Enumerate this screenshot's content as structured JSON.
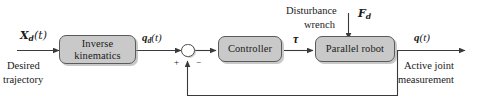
{
  "diagram": {
    "colors": {
      "block_fill": "#c9c9c9",
      "block_border": "#5a5a5a",
      "wire": "#3a3a3a",
      "text": "#1a1a1a",
      "background": "#ffffff"
    },
    "blocks": [
      {
        "id": "inverse-kinematics",
        "line1": "Inverse",
        "line2": "kinematics"
      },
      {
        "id": "controller",
        "line1": "Controller",
        "line2": ""
      },
      {
        "id": "parallel-robot",
        "line1": "Parallel robot",
        "line2": ""
      }
    ],
    "signals": {
      "input_symbol": {
        "base": "X",
        "sub": "d",
        "arg": "(t)"
      },
      "input_caption_line1": "Desired",
      "input_caption_line2": "trajectory",
      "desired_joint_symbol": {
        "base": "q",
        "sub": "d",
        "arg": "(t)"
      },
      "torque_symbol": "τ",
      "disturbance_symbol": {
        "base": "F",
        "sub": "d",
        "arg": ""
      },
      "disturbance_caption_line1": "Disturbance",
      "disturbance_caption_line2": "wrench",
      "output_symbol": {
        "base": "q",
        "sub": "",
        "arg": "(t)"
      },
      "output_caption_line1": "Active joint",
      "output_caption_line2": "measurement"
    },
    "summing_junction": {
      "id": "summing-junction",
      "plus_sign": "+",
      "minus_sign": "−"
    }
  }
}
